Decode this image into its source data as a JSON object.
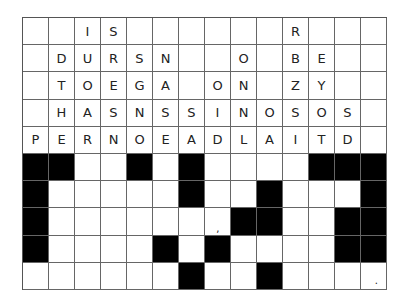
{
  "puzzle": {
    "columns": 14,
    "rows": 10,
    "letter_rows": [
      [
        "",
        "",
        "I",
        "S",
        "",
        "",
        "",
        "",
        "",
        "",
        "R",
        "",
        "",
        ""
      ],
      [
        "",
        "D",
        "U",
        "R",
        "S",
        "N",
        "",
        "",
        "O",
        "",
        "B",
        "E",
        "",
        ""
      ],
      [
        "",
        "T",
        "O",
        "E",
        "G",
        "A",
        "",
        "O",
        "N",
        "",
        "Z",
        "Y",
        "",
        ""
      ],
      [
        "",
        "H",
        "A",
        "S",
        "N",
        "S",
        "S",
        "I",
        "N",
        "O",
        "S",
        "O",
        "S",
        ""
      ],
      [
        "P",
        "E",
        "R",
        "N",
        "O",
        "E",
        "A",
        "D",
        "L",
        "A",
        "I",
        "T",
        "D",
        ""
      ]
    ],
    "answer_grid": [
      "BB..B.B....BBB",
      "B.....B..B...B",
      "B.......BB..BB",
      "B....B.B....BB",
      "......B..B...."
    ],
    "marks": [
      {
        "row": 7,
        "col": 7,
        "text": ","
      },
      {
        "row": 9,
        "col": 13,
        "text": "."
      }
    ]
  }
}
